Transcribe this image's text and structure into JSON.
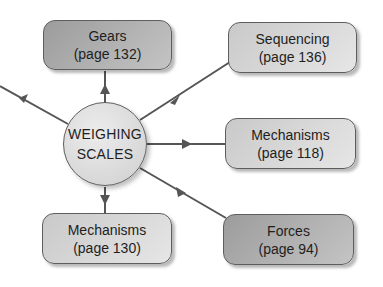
{
  "diagram": {
    "type": "mind-map",
    "colors": {
      "line": "#555555",
      "dark_box": "#a8a8a8",
      "light_box": "#d9d9d9",
      "hub": "#e2e2e2"
    },
    "hub": {
      "line1": "WEIGHING",
      "line2": "SCALES"
    },
    "nodes": [
      {
        "id": "gears",
        "title": "Gears",
        "page": "(page 132)",
        "shade": "dark"
      },
      {
        "id": "sequencing",
        "title": "Sequencing",
        "page": "(page 136)",
        "shade": "light"
      },
      {
        "id": "mechanisms-118",
        "title": "Mechanisms",
        "page": "(page 118)",
        "shade": "light"
      },
      {
        "id": "forces",
        "title": "Forces",
        "page": "(page 94)",
        "shade": "dark"
      },
      {
        "id": "mechanisms-130",
        "title": "Mechanisms",
        "page": "(page 130)",
        "shade": "light"
      }
    ],
    "edges": [
      {
        "from": "hub",
        "to": "gears"
      },
      {
        "from": "hub",
        "to": "sequencing"
      },
      {
        "from": "hub",
        "to": "mechanisms-118"
      },
      {
        "from": "hub",
        "to": "forces"
      },
      {
        "from": "hub",
        "to": "mechanisms-130"
      },
      {
        "from": "hub",
        "to": "off-page-left"
      }
    ]
  }
}
